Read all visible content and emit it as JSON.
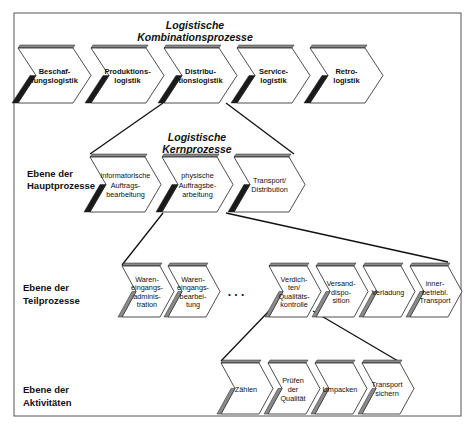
{
  "titles": {
    "combination": [
      "Logistische",
      "Kombinationsprozesse"
    ],
    "core": [
      "Logistische",
      "Kernprozesse"
    ]
  },
  "levels": {
    "main": [
      "Ebene der",
      "Hauptprozesse"
    ],
    "sub": [
      "Ebene der",
      "Teilprozesse"
    ],
    "activities": [
      "Ebene der",
      "Aktivitäten"
    ]
  },
  "combination_processes": [
    {
      "lines": [
        "Beschaf-",
        "fungslogistik"
      ]
    },
    {
      "lines": [
        "Produktions-",
        "logistik"
      ]
    },
    {
      "lines": [
        "Distribu-",
        "tionslogistik"
      ]
    },
    {
      "lines": [
        "Service-",
        "logistik"
      ]
    },
    {
      "lines": [
        "Retro-",
        "logistik"
      ]
    }
  ],
  "core_processes": [
    {
      "lines": [
        "informatorische",
        "Auftrags-",
        "bearbeitung"
      ]
    },
    {
      "lines": [
        "physische",
        "Auftragsbe-",
        "arbeitung"
      ]
    },
    {
      "lines": [
        "Transport/",
        "Distribution"
      ]
    }
  ],
  "sub_processes_left": [
    {
      "lines": [
        "Waren-",
        "eingangs-",
        "adminis-",
        "tration"
      ]
    },
    {
      "lines": [
        "Waren-",
        "eingangs-",
        "bearbei-",
        "tung"
      ]
    }
  ],
  "ellipsis": ". . .",
  "sub_processes_right": [
    {
      "lines": [
        "Verdich-",
        "ten/",
        "Qualitäts-",
        "kontrolle"
      ]
    },
    {
      "lines": [
        "Versand-",
        "dispo-",
        "sition"
      ]
    },
    {
      "lines": [
        "Verladung"
      ]
    },
    {
      "lines": [
        "inner-",
        "betriebl.",
        "Transport"
      ]
    }
  ],
  "activities": [
    {
      "lines": [
        "Zählen"
      ]
    },
    {
      "lines": [
        "Prüfen",
        "der",
        "Qualität"
      ]
    },
    {
      "lines": [
        "Umpacken"
      ]
    },
    {
      "lines": [
        "Transport",
        "sichern"
      ]
    }
  ],
  "colors": {
    "stroke": "#222222",
    "topbar": "#8a8a8a",
    "sidebar_dark": "#1a1a1a",
    "sidebar_grey": "#8a8a8a"
  }
}
